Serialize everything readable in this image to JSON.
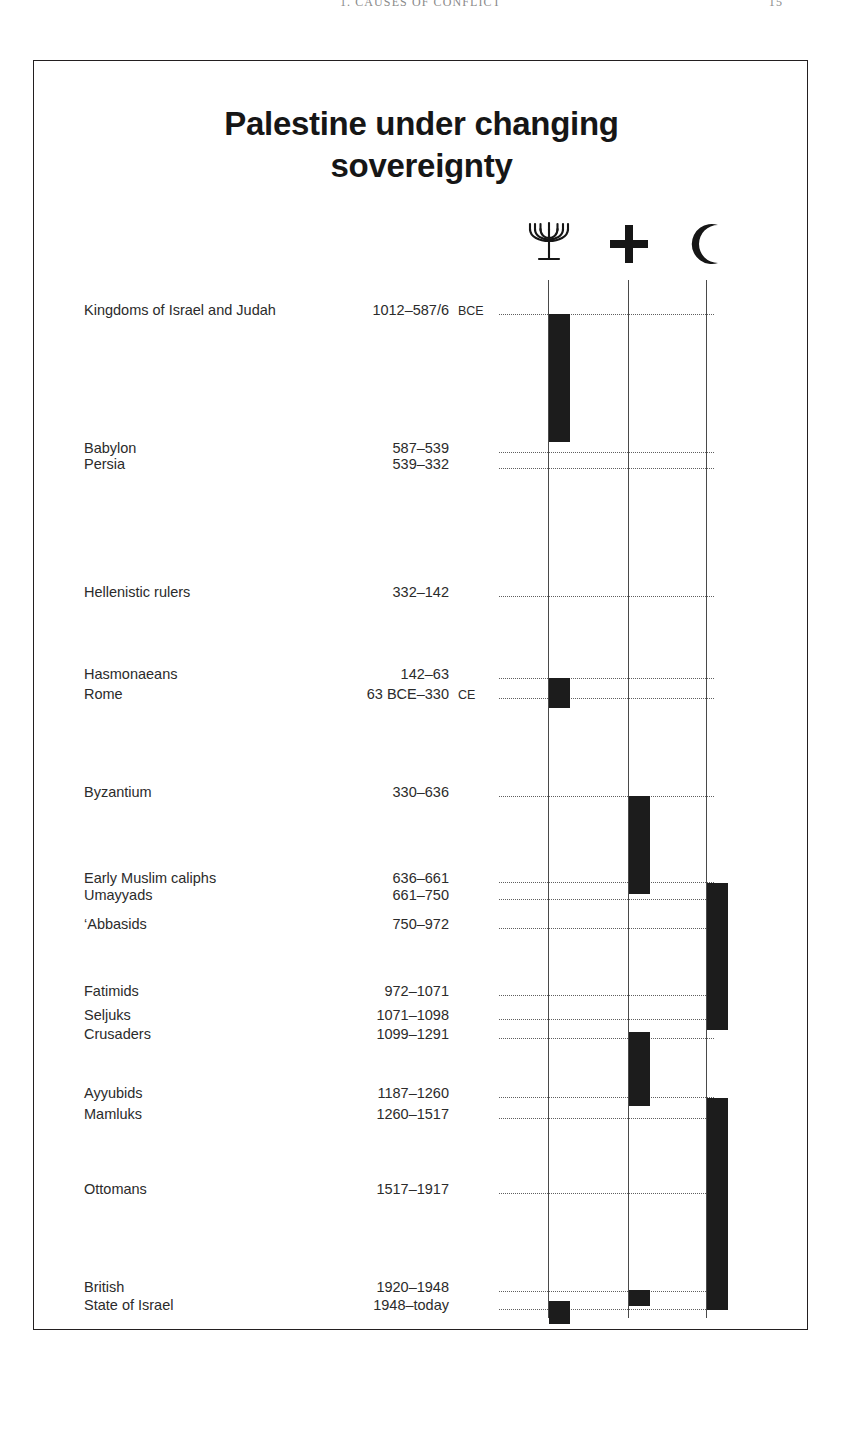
{
  "page_header": {
    "running_title": "1. CAUSES OF CONFLICT",
    "folio": "15"
  },
  "figure": {
    "title_line1": "Palestine under changing",
    "title_line2": "sovereignty",
    "columns": [
      {
        "key": "jewish",
        "icon": "menorah-icon",
        "glyph": "✡",
        "label": "Jewish"
      },
      {
        "key": "christian",
        "icon": "cross-icon",
        "glyph": "✚",
        "label": "Christian"
      },
      {
        "key": "muslim",
        "icon": "crescent-icon",
        "glyph": "☾",
        "label": "Muslim"
      }
    ],
    "rows": [
      {
        "name": "Kingdoms of Israel and Judah",
        "dates": "1012–587/6",
        "era": "BCE"
      },
      {
        "name": "Babylon",
        "dates": "587–539",
        "era": ""
      },
      {
        "name": "Persia",
        "dates": "539–332",
        "era": ""
      },
      {
        "name": "Hellenistic rulers",
        "dates": "332–142",
        "era": ""
      },
      {
        "name": "Hasmonaeans",
        "dates": "142–63",
        "era": ""
      },
      {
        "name": "Rome",
        "dates": "63 BCE–330",
        "era": "CE"
      },
      {
        "name": "Byzantium",
        "dates": "330–636",
        "era": ""
      },
      {
        "name": "Early Muslim caliphs",
        "dates": "636–661",
        "era": ""
      },
      {
        "name": "Umayyads",
        "dates": "661–750",
        "era": ""
      },
      {
        "name": "‘Abbasids",
        "dates": "750–972",
        "era": ""
      },
      {
        "name": "Fatimids",
        "dates": "972–1071",
        "era": ""
      },
      {
        "name": "Seljuks",
        "dates": "1071–1098",
        "era": ""
      },
      {
        "name": "Crusaders",
        "dates": "1099–1291",
        "era": ""
      },
      {
        "name": "Ayyubids",
        "dates": "1187–1260",
        "era": ""
      },
      {
        "name": "Mamluks",
        "dates": "1260–1517",
        "era": ""
      },
      {
        "name": "Ottomans",
        "dates": "1517–1917",
        "era": ""
      },
      {
        "name": "British",
        "dates": "1920–1948",
        "era": ""
      },
      {
        "name": "State of Israel",
        "dates": "1948–today",
        "era": ""
      }
    ]
  },
  "chart_data": {
    "type": "timeline",
    "title": "Palestine under changing sovereignty",
    "xlabel": "",
    "ylabel": "",
    "orientation": "vertical-time-descending",
    "grid": "dotted-leaders-per-row",
    "legend_position": "top-right-icons",
    "categories": [
      "Jewish",
      "Christian",
      "Muslim"
    ],
    "category_icons": [
      "menorah",
      "cross",
      "crescent"
    ],
    "periods": [
      {
        "name": "Kingdoms of Israel and Judah",
        "dates": "1012–587/6 BCE",
        "start": -1012,
        "end": -587,
        "column": "jewish"
      },
      {
        "name": "Babylon",
        "dates": "587–539 BCE",
        "start": -587,
        "end": -539,
        "column": null
      },
      {
        "name": "Persia",
        "dates": "539–332 BCE",
        "start": -539,
        "end": -332,
        "column": null
      },
      {
        "name": "Hellenistic rulers",
        "dates": "332–142 BCE",
        "start": -332,
        "end": -142,
        "column": null
      },
      {
        "name": "Hasmonaeans",
        "dates": "142–63 BCE",
        "start": -142,
        "end": -63,
        "column": "jewish"
      },
      {
        "name": "Rome",
        "dates": "63 BCE–330 CE",
        "start": -63,
        "end": 330,
        "column": null
      },
      {
        "name": "Byzantium",
        "dates": "330–636 CE",
        "start": 330,
        "end": 636,
        "column": "christian"
      },
      {
        "name": "Early Muslim caliphs",
        "dates": "636–661 CE",
        "start": 636,
        "end": 661,
        "column": "christian"
      },
      {
        "name": "Umayyads",
        "dates": "661–750 CE",
        "start": 661,
        "end": 750,
        "column": "muslim"
      },
      {
        "name": "‘Abbasids",
        "dates": "750–972 CE",
        "start": 750,
        "end": 972,
        "column": "muslim"
      },
      {
        "name": "Fatimids",
        "dates": "972–1071 CE",
        "start": 972,
        "end": 1071,
        "column": "muslim"
      },
      {
        "name": "Seljuks",
        "dates": "1071–1098 CE",
        "start": 1071,
        "end": 1098,
        "column": "muslim"
      },
      {
        "name": "Crusaders",
        "dates": "1099–1291 CE",
        "start": 1099,
        "end": 1291,
        "column": "christian"
      },
      {
        "name": "Ayyubids",
        "dates": "1187–1260 CE",
        "start": 1187,
        "end": 1260,
        "column": "muslim"
      },
      {
        "name": "Mamluks",
        "dates": "1260–1517 CE",
        "start": 1260,
        "end": 1517,
        "column": "muslim"
      },
      {
        "name": "Ottomans",
        "dates": "1517–1917 CE",
        "start": 1517,
        "end": 1917,
        "column": "muslim"
      },
      {
        "name": "British",
        "dates": "1920–1948 CE",
        "start": 1920,
        "end": 1948,
        "column": "christian"
      },
      {
        "name": "State of Israel",
        "dates": "1948–today",
        "start": 1948,
        "end": null,
        "column": "jewish"
      }
    ]
  },
  "layout": {
    "columns_x": {
      "jewish": 514,
      "christian": 594,
      "muslim": 672
    },
    "rows_y": [
      253,
      391,
      407,
      535,
      617,
      637,
      735,
      821,
      838,
      867,
      934,
      958,
      977,
      1036,
      1057,
      1132,
      1230,
      1248
    ],
    "bars": [
      {
        "column": "jewish",
        "top": 253,
        "height": 128,
        "name": "kingdoms-of-israel-and-judah"
      },
      {
        "column": "jewish",
        "top": 617,
        "height": 30,
        "name": "hasmonaeans"
      },
      {
        "column": "christian",
        "top": 735,
        "height": 98,
        "name": "byzantium-early-caliphs"
      },
      {
        "column": "muslim",
        "top": 822,
        "height": 147,
        "name": "umayyads-abbasids-fatimids"
      },
      {
        "column": "christian",
        "top": 971,
        "height": 74,
        "name": "crusaders"
      },
      {
        "column": "muslim",
        "top": 1037,
        "height": 212,
        "name": "ayyubids-mamluks-ottomans"
      },
      {
        "column": "christian",
        "top": 1229,
        "height": 16,
        "name": "british"
      },
      {
        "column": "jewish",
        "top": 1240,
        "height": 23,
        "name": "state-of-israel"
      }
    ],
    "leaders_y": [
      253,
      391,
      407,
      535,
      617,
      637,
      735,
      821,
      838,
      867,
      934,
      958,
      977,
      1036,
      1057,
      1132,
      1230,
      1248
    ]
  }
}
